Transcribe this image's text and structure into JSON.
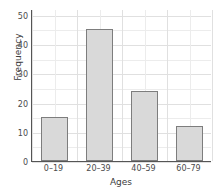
{
  "chart_data": {
    "type": "bar",
    "title": "",
    "categories": [
      "0–19",
      "20–39",
      "40–59",
      "60–79"
    ],
    "values": [
      15,
      45,
      24,
      12
    ],
    "xlabel": "Ages",
    "ylabel": "Frequency",
    "ylim": [
      0,
      52
    ],
    "yticks": [
      0,
      10,
      20,
      30,
      40,
      50
    ],
    "ytick_labels": [
      "0",
      "10",
      "20",
      "30",
      "40",
      "50"
    ],
    "y_minor_step": 5,
    "grid": true,
    "legend": null,
    "bar_fill_color": "#d9d9d9",
    "bar_edge_color": "#7d7d7d",
    "axis_color": "#555555",
    "grid_color": "#ececec",
    "background_color": "#ffffff"
  }
}
